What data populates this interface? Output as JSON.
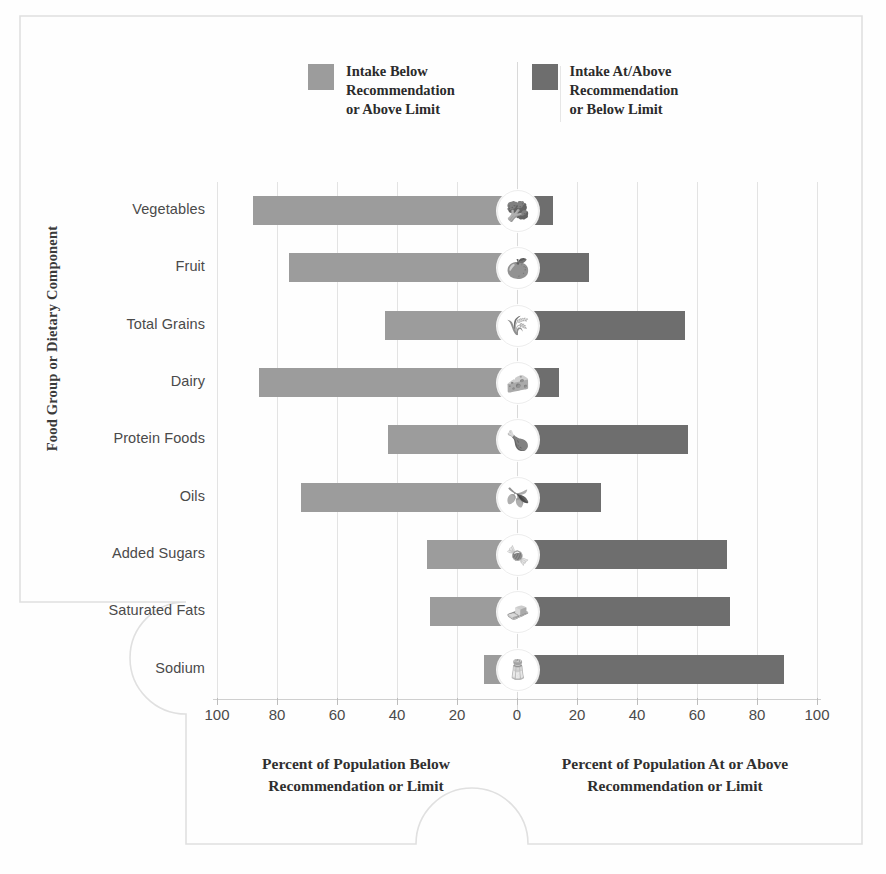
{
  "legend": {
    "items": [
      {
        "label": "Intake Below\nRecommendation\nor Above Limit",
        "color": "#9c9c9c",
        "name": "below"
      },
      {
        "label": "Intake At/Above\nRecommendation\nor Below Limit",
        "color": "#6e6e6e",
        "name": "above"
      }
    ]
  },
  "axes": {
    "ytitle": "Food Group or Dietary Component",
    "xticks": [
      "100",
      "80",
      "60",
      "40",
      "20",
      "0",
      "20",
      "40",
      "60",
      "80",
      "100"
    ],
    "caption_left": "Percent of Population Below\nRecommendation or Limit",
    "caption_right": "Percent of Population At or\nAbove Recommendation or Limit"
  },
  "chart_data": {
    "type": "bar",
    "title": "",
    "subtitle": "",
    "orientation": "horizontal-diverging",
    "xlabel": "Percent of Population",
    "ylabel": "Food Group or Dietary Component",
    "xlim": [
      -100,
      100
    ],
    "xticks": [
      -100,
      -80,
      -60,
      -40,
      -20,
      0,
      20,
      40,
      60,
      80,
      100
    ],
    "xtick_labels": [
      "100",
      "80",
      "60",
      "40",
      "20",
      "0",
      "20",
      "40",
      "60",
      "80",
      "100"
    ],
    "grid": true,
    "legend_position": "top",
    "categories": [
      "Vegetables",
      "Fruit",
      "Total Grains",
      "Dairy",
      "Protein Foods",
      "Oils",
      "Added Sugars",
      "Saturated Fats",
      "Sodium"
    ],
    "series": [
      {
        "name": "Intake Below Recommendation or Above Limit",
        "color": "#9c9c9c",
        "side": "left",
        "values": [
          88,
          76,
          44,
          86,
          43,
          72,
          30,
          29,
          11
        ]
      },
      {
        "name": "Intake At/Above Recommendation or Below Limit",
        "color": "#6e6e6e",
        "side": "right",
        "values": [
          12,
          24,
          56,
          14,
          57,
          28,
          70,
          71,
          89
        ]
      }
    ],
    "icons": [
      {
        "category": "Vegetables",
        "icon": "broccoli-icon",
        "glyph": "🥦"
      },
      {
        "category": "Fruit",
        "icon": "fruit-slice-icon",
        "glyph": "🍊"
      },
      {
        "category": "Total Grains",
        "icon": "grain-icon",
        "glyph": "🌾"
      },
      {
        "category": "Dairy",
        "icon": "cheese-icon",
        "glyph": "🧀"
      },
      {
        "category": "Protein Foods",
        "icon": "protein-icon",
        "glyph": "🍗"
      },
      {
        "category": "Oils",
        "icon": "oil-bottle-icon",
        "glyph": "🫒"
      },
      {
        "category": "Added Sugars",
        "icon": "sugar-cubes-icon",
        "glyph": "🍬"
      },
      {
        "category": "Saturated Fats",
        "icon": "butter-icon",
        "glyph": "🧈"
      },
      {
        "category": "Sodium",
        "icon": "salt-shaker-icon",
        "glyph": "🧂"
      }
    ]
  }
}
